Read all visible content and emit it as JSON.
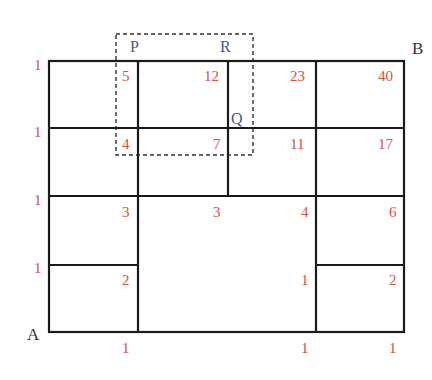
{
  "diagram": {
    "type": "grid-path-counting",
    "colors": {
      "numbers": "#d9503f",
      "points": "#3d5a96",
      "corners": "#333333",
      "lines": "#1a1a1a"
    },
    "corners": {
      "start": "A",
      "end": "B"
    },
    "points": {
      "P": "P",
      "R": "R",
      "Q": "Q"
    },
    "left_column_counts": [
      "1",
      "1",
      "1",
      "1"
    ],
    "bottom_row_counts": [
      "1",
      "1",
      "1"
    ],
    "row1": [
      "5",
      "12",
      "23",
      "40"
    ],
    "row2": [
      "4",
      "7",
      "11",
      "17"
    ],
    "row3": [
      "3",
      "3",
      "4",
      "6"
    ],
    "row4": [
      "2",
      "1",
      "2"
    ]
  }
}
